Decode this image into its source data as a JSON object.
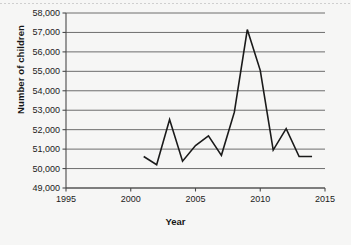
{
  "chart_data": {
    "type": "line",
    "title": "",
    "xlabel": "Year",
    "ylabel": "Number of children",
    "xlim": [
      1995,
      2015
    ],
    "ylim": [
      49000,
      58000
    ],
    "xticks": [
      1995,
      2000,
      2005,
      2010,
      2015
    ],
    "xtick_labels": [
      "1995",
      "2000",
      "2005",
      "2010",
      "2015"
    ],
    "yticks": [
      49000,
      50000,
      51000,
      52000,
      53000,
      54000,
      55000,
      56000,
      57000,
      58000
    ],
    "ytick_labels": [
      "49,000",
      "50,000",
      "51,000",
      "52,000",
      "53,000",
      "54,000",
      "55,000",
      "56,000",
      "57,000",
      "58,000"
    ],
    "grid": "horizontal",
    "legend": "none",
    "series": [
      {
        "name": "Number of children",
        "color": "#1a1a1a",
        "line_width": 1.6,
        "x": [
          2001,
          2002,
          2003,
          2004,
          2005,
          2006,
          2007,
          2008,
          2009,
          2010,
          2011,
          2012,
          2013,
          2014
        ],
        "values": [
          50620,
          50200,
          52520,
          50380,
          51180,
          51680,
          50680,
          52900,
          57150,
          55050,
          50950,
          52050,
          50620,
          50620
        ]
      }
    ]
  },
  "axis": {
    "x_title": "Year",
    "y_title": "Number of children"
  }
}
